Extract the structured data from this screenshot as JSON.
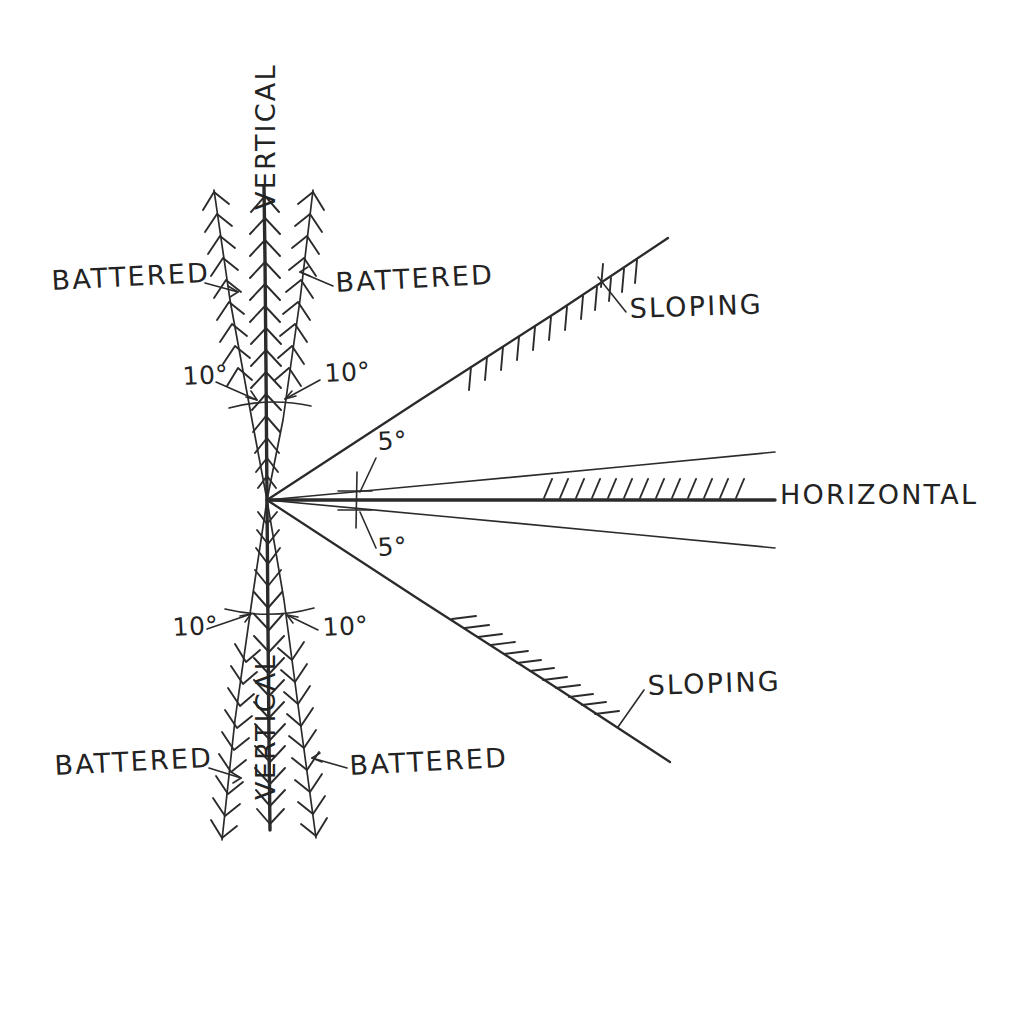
{
  "diagram": {
    "background_color": "#ffffff",
    "ink_color": "#2b2b2b",
    "origin": {
      "x": 267,
      "y": 500
    },
    "labels": {
      "battered": "BATTERED",
      "vertical": "VERTICAL",
      "sloping": "SLOPING",
      "horizontal": "HORIZONTAL",
      "angle_ten": "10°",
      "angle_five": "5°"
    },
    "text_items": [
      {
        "id": "battered-top-left",
        "text": "BATTERED",
        "x": 52,
        "y": 290,
        "rotation": -3
      },
      {
        "id": "battered-top-right",
        "text": "BATTERED",
        "x": 336,
        "y": 292,
        "rotation": -3
      },
      {
        "id": "battered-bottom-left",
        "text": "BATTERED",
        "x": 55,
        "y": 775,
        "rotation": -3
      },
      {
        "id": "battered-bottom-right",
        "text": "BATTERED",
        "x": 350,
        "y": 775,
        "rotation": -3
      },
      {
        "id": "vertical-top",
        "text": "VERTICAL",
        "x": 275,
        "y": 210,
        "rotation": -90
      },
      {
        "id": "vertical-bottom",
        "text": "VERTICAL",
        "x": 275,
        "y": 800,
        "rotation": -90
      },
      {
        "id": "sloping-upper",
        "text": "SLOPING",
        "x": 630,
        "y": 318,
        "rotation": -2
      },
      {
        "id": "sloping-lower",
        "text": "SLOPING",
        "x": 648,
        "y": 695,
        "rotation": -2
      },
      {
        "id": "horizontal-right",
        "text": "HORIZONTAL",
        "x": 780,
        "y": 504,
        "rotation": 0
      },
      {
        "id": "ten-deg-top-left",
        "text": "10°",
        "x": 183,
        "y": 385,
        "rotation": -3
      },
      {
        "id": "ten-deg-top-right",
        "text": "10°",
        "x": 325,
        "y": 382,
        "rotation": -3
      },
      {
        "id": "ten-deg-bottom-left",
        "text": "10°",
        "x": 173,
        "y": 636,
        "rotation": -3
      },
      {
        "id": "ten-deg-bottom-right",
        "text": "10°",
        "x": 323,
        "y": 636,
        "rotation": -3
      },
      {
        "id": "five-deg-upper",
        "text": "5°",
        "x": 378,
        "y": 450,
        "rotation": -3
      },
      {
        "id": "five-deg-lower",
        "text": "5°",
        "x": 378,
        "y": 556,
        "rotation": -3
      }
    ],
    "rays": [
      {
        "id": "vertical-up",
        "label": "VERTICAL",
        "angle_deg": 90,
        "length": 318,
        "weight": "heavy",
        "barbs": true
      },
      {
        "id": "vertical-down",
        "label": "VERTICAL",
        "angle_deg": -90,
        "length": 330,
        "weight": "heavy",
        "barbs": true
      },
      {
        "id": "battered-up-left",
        "label": "BATTERED",
        "angle_deg": 100,
        "length": 320,
        "weight": "thin",
        "barbs": true
      },
      {
        "id": "battered-up-right",
        "label": "BATTERED",
        "angle_deg": 80,
        "length": 320,
        "weight": "thin",
        "barbs": true
      },
      {
        "id": "battered-down-left",
        "label": "BATTERED",
        "angle_deg": -100,
        "length": 335,
        "weight": "thin",
        "barbs": true
      },
      {
        "id": "battered-down-right",
        "label": "BATTERED",
        "angle_deg": -80,
        "length": 335,
        "weight": "thin",
        "barbs": true
      },
      {
        "id": "sloping-upper",
        "label": "SLOPING",
        "angle_deg": 33,
        "length": 478,
        "weight": "medium",
        "barbs": false
      },
      {
        "id": "sloping-lower",
        "label": "SLOPING",
        "angle_deg": -33,
        "length": 478,
        "weight": "medium",
        "barbs": false
      },
      {
        "id": "horizontal-main",
        "label": "HORIZONTAL",
        "angle_deg": 0,
        "length": 508,
        "weight": "heavy",
        "barbs": false
      },
      {
        "id": "horizontal-upper-5",
        "label": "5°",
        "angle_deg": 5,
        "length": 508,
        "weight": "thin",
        "barbs": false
      },
      {
        "id": "horizontal-lower-5",
        "label": "5°",
        "angle_deg": -5,
        "length": 508,
        "weight": "thin",
        "barbs": false
      }
    ],
    "angle_arcs": [
      {
        "id": "arc-batter-top",
        "value": "10°",
        "y": 405,
        "x_from": 229,
        "x_to": 310
      },
      {
        "id": "arc-batter-bottom",
        "value": "10°",
        "y": 612,
        "x_from": 225,
        "x_to": 314
      },
      {
        "id": "tick-five-deg",
        "value": "5°",
        "x": 357,
        "y_from": 473,
        "y_to": 527
      }
    ],
    "hatched_ground_lines": [
      {
        "id": "hatch-sloping-upper",
        "on": "sloping-upper",
        "tick_count": 13,
        "tick_direction": "vertical-down"
      },
      {
        "id": "hatch-sloping-lower",
        "on": "sloping-lower",
        "tick_count": 12,
        "tick_direction": "horizontal-left"
      },
      {
        "id": "hatch-horizontal",
        "on": "horizontal-main",
        "tick_count": 13,
        "tick_direction": "leaning-right-up"
      }
    ]
  }
}
